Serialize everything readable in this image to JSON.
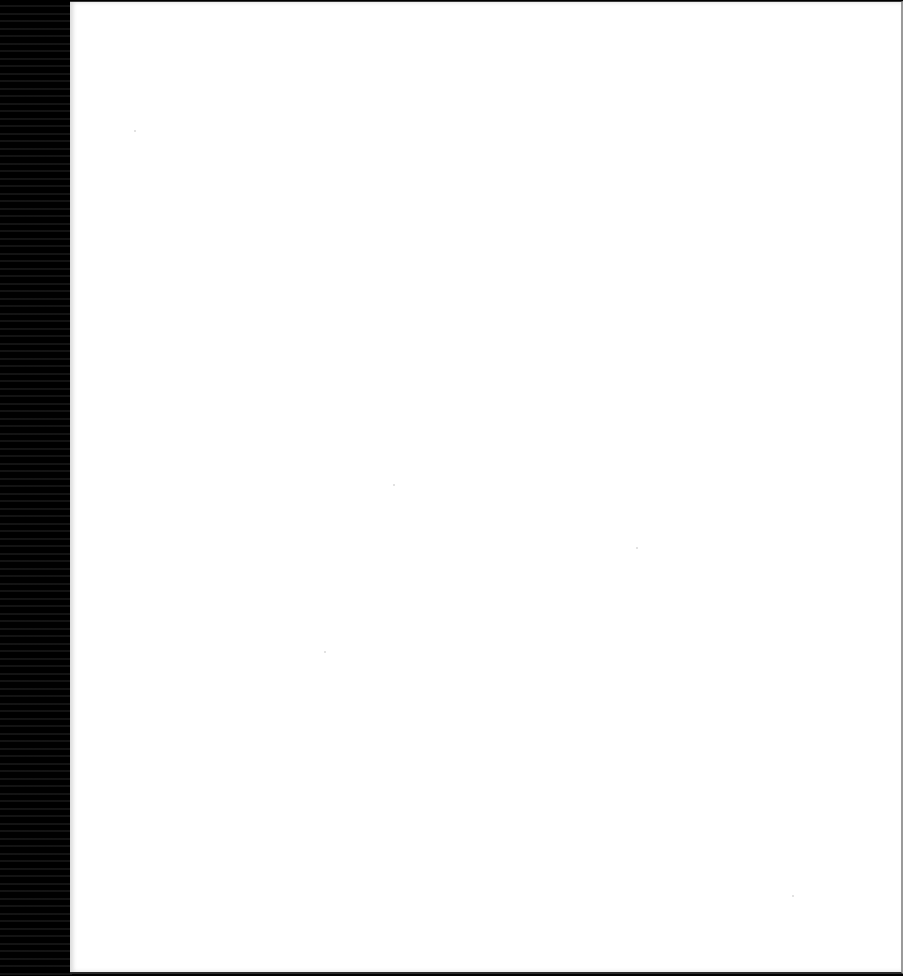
{
  "document": {
    "type": "scanned-page",
    "content": "",
    "colors": {
      "page": "#ffffff",
      "scan_edge": "#000000",
      "border": "#3a3a3a"
    }
  }
}
